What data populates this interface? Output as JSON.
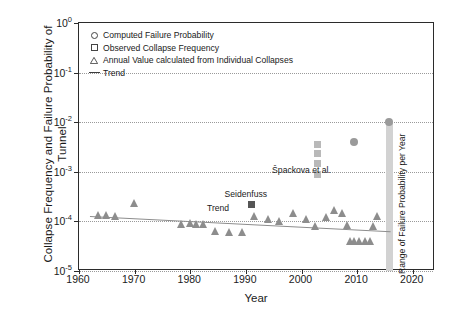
{
  "chart_data": {
    "type": "scatter",
    "title": "",
    "xlabel": "Year",
    "ylabel": "Collapse Frequency and Failure Probability of Tunnel",
    "xlim": [
      1960,
      2024
    ],
    "ylim_exponents": [
      -5,
      0
    ],
    "yscale": "log",
    "grid": "horizontal-dotted",
    "legend_position": "top-left",
    "xticks": [
      "1960",
      "1970",
      "1980",
      "1990",
      "2000",
      "2010",
      "2020"
    ],
    "yticks": [
      "10^0",
      "10^-1",
      "10^-2",
      "10^-3",
      "10^-4",
      "10^-5"
    ],
    "ytick_bases": [
      "10",
      "10",
      "10",
      "10",
      "10",
      "10"
    ],
    "ytick_exponents": [
      "0",
      "-1",
      "-2",
      "-3",
      "-4",
      "-5"
    ],
    "legend": [
      {
        "marker": "circle-open",
        "label": "Computed Failure Probability"
      },
      {
        "marker": "square-open",
        "label": "Observed Collapse Frequency"
      },
      {
        "marker": "triangle-open",
        "label": "Annual Value calculated from Individual Collapses"
      },
      {
        "marker": "line",
        "label": "Trend"
      }
    ],
    "annotations": [
      {
        "text": "Špackova et al.",
        "x": 2000,
        "y": 0.0011
      },
      {
        "text": "Seidenfuss",
        "x": 1990,
        "y": 0.00036
      },
      {
        "text": "Trend",
        "x": 1985,
        "y": 0.00019
      },
      {
        "text": "Range of Failure Probability per Year",
        "x": 2016,
        "y": 0.0003,
        "rotation": -90
      }
    ],
    "series": [
      {
        "name": "Annual Value calculated from Individual Collapses",
        "marker": "triangle",
        "color": "#8d8d8d",
        "points": [
          {
            "x": 1963.5,
            "y": 0.000135
          },
          {
            "x": 1965.0,
            "y": 0.000135
          },
          {
            "x": 1966.5,
            "y": 0.00013
          },
          {
            "x": 1970.0,
            "y": 0.00023
          },
          {
            "x": 1978.5,
            "y": 9e-05
          },
          {
            "x": 1980.0,
            "y": 9.5e-05
          },
          {
            "x": 1981.2,
            "y": 9e-05
          },
          {
            "x": 1982.4,
            "y": 9e-05
          },
          {
            "x": 1984.5,
            "y": 6.5e-05
          },
          {
            "x": 1987.0,
            "y": 6e-05
          },
          {
            "x": 1989.5,
            "y": 6e-05
          },
          {
            "x": 1991.5,
            "y": 0.00013
          },
          {
            "x": 1994.0,
            "y": 0.00011
          },
          {
            "x": 1996.0,
            "y": 0.0001
          },
          {
            "x": 1998.5,
            "y": 0.000145
          },
          {
            "x": 2001.0,
            "y": 0.00011
          },
          {
            "x": 2002.5,
            "y": 8e-05
          },
          {
            "x": 2004.5,
            "y": 0.00012
          },
          {
            "x": 2006.0,
            "y": 0.00017
          },
          {
            "x": 2007.3,
            "y": 0.000145
          },
          {
            "x": 2008.2,
            "y": 8.5e-05
          },
          {
            "x": 2008.9,
            "y": 4e-05
          },
          {
            "x": 2009.6,
            "y": 4e-05
          },
          {
            "x": 2010.4,
            "y": 4e-05
          },
          {
            "x": 2011.6,
            "y": 4e-05
          },
          {
            "x": 2012.4,
            "y": 4e-05
          },
          {
            "x": 2013.0,
            "y": 8e-05
          },
          {
            "x": 2013.6,
            "y": 0.00013
          }
        ]
      },
      {
        "name": "Observed Collapse Frequency (Špackova et al.)",
        "marker": "square",
        "color": "#b9b9b9",
        "points": [
          {
            "x": 2002.8,
            "y": 0.0036
          },
          {
            "x": 2002.8,
            "y": 0.0023
          },
          {
            "x": 2002.8,
            "y": 0.0015
          },
          {
            "x": 2002.8,
            "y": 0.0009
          }
        ]
      },
      {
        "name": "Observed Collapse Frequency (Seidenfuss)",
        "marker": "square-filled",
        "color": "#555555",
        "points": [
          {
            "x": 1991.0,
            "y": 0.00022
          }
        ]
      },
      {
        "name": "Computed Failure Probability",
        "marker": "circle-filled",
        "color": "#9a9a9a",
        "points": [
          {
            "x": 2009.5,
            "y": 0.0039
          },
          {
            "x": 2015.8,
            "y": 0.01
          }
        ]
      }
    ],
    "trend": {
      "name": "Trend",
      "color": "#8d8d8d",
      "x_start": 1962.0,
      "y_start": 0.00013,
      "x_end": 2016.0,
      "y_end": 6.4e-05
    },
    "band": {
      "label": "Range of Failure Probability per Year",
      "x": 2015.8,
      "y_top": 0.01,
      "y_bottom": 1e-05,
      "color": "#d2d2d2"
    }
  }
}
